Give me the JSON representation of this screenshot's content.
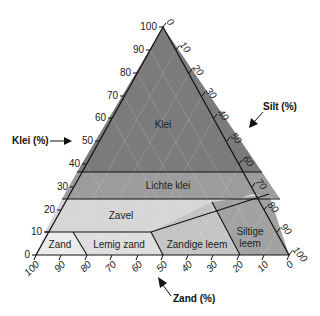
{
  "diagram": {
    "type": "soil-texture-triangle",
    "axes": {
      "clay": {
        "title": "Klei (%)",
        "ticks": [
          "0",
          "10",
          "20",
          "30",
          "40",
          "50",
          "60",
          "70",
          "80",
          "90",
          "100"
        ]
      },
      "silt": {
        "title": "Silt (%)",
        "ticks": [
          "0",
          "10",
          "20",
          "30",
          "40",
          "50",
          "60",
          "70",
          "80",
          "90",
          "100"
        ]
      },
      "sand": {
        "title": "Zand (%)",
        "ticks": [
          "100",
          "90",
          "80",
          "70",
          "60",
          "50",
          "40",
          "30",
          "20",
          "10",
          "0"
        ]
      }
    },
    "regions": [
      {
        "name": "Klei",
        "color": "#7b7b7b"
      },
      {
        "name": "Lichte klei",
        "color": "#9c9c9c"
      },
      {
        "name": "Zavel",
        "color": "#d6d6d6"
      },
      {
        "name": "Zand",
        "color": "#ebebeb"
      },
      {
        "name": "Lemig zand",
        "color": "#dedede"
      },
      {
        "name": "Zandige leem",
        "color": "#c4c4c4"
      },
      {
        "name": "Siltige leem",
        "color": "#a2a2a2"
      }
    ],
    "siltige_leem_line1": "Siltige",
    "siltige_leem_line2": "leem"
  }
}
